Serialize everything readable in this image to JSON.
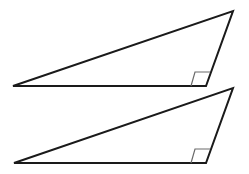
{
  "diagram": {
    "stroke_color": "#1a1a1a",
    "marker_color": "#6b6b6b",
    "triangles": [
      {
        "id": "top",
        "vertices": {
          "left": [
            13,
            86
          ],
          "right_angle": [
            206,
            86
          ],
          "apex": [
            233,
            11
          ]
        },
        "right_angle_marker": [
          [
            191,
            86
          ],
          [
            195,
            72
          ],
          [
            210,
            72
          ]
        ]
      },
      {
        "id": "bottom",
        "vertices": {
          "left": [
            14,
            163
          ],
          "right_angle": [
            206,
            163
          ],
          "apex": [
            233,
            88
          ]
        },
        "right_angle_marker": [
          [
            191,
            163
          ],
          [
            195,
            149
          ],
          [
            210,
            149
          ]
        ]
      }
    ]
  }
}
